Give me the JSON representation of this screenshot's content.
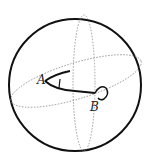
{
  "diagram": {
    "type": "sphere-geometry",
    "labels": {
      "point_a": "A",
      "point_b": "B"
    },
    "elements": [
      "outer-sphere-circle",
      "equator-dotted-ellipse",
      "meridian-dotted-ellipse",
      "arc-from-a-upper",
      "curve-from-a-to-b",
      "angle-mark-at-a",
      "loop-at-b"
    ],
    "colors": {
      "stroke": "#111111",
      "dotted": "#888888",
      "background": "#ffffff"
    }
  }
}
